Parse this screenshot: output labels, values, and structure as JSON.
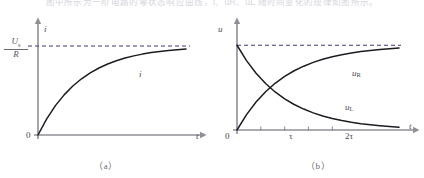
{
  "top_caption": "图中所示为一阶电路的零状态响应曲线，i、uR、uL 随时间变化的规律如图所示。",
  "panels": [
    {
      "id": "a",
      "caption": "（a）",
      "y_axis_label": "i",
      "x_axis_label": "t",
      "origin_label": "0",
      "asymptote_label_numerator": "U",
      "asymptote_label_numerator_sub": "s",
      "asymptote_label_denominator": "R",
      "curve_labels": [
        "i"
      ],
      "tick_labels": []
    },
    {
      "id": "b",
      "caption": "（b）",
      "y_axis_label": "u",
      "x_axis_label": "t",
      "origin_label": "0",
      "asymptote_label_numerator": "",
      "asymptote_label_numerator_sub": "",
      "asymptote_label_denominator": "",
      "curve_labels": [
        "uR",
        "uL"
      ],
      "curve_label_uR_base": "u",
      "curve_label_uR_sub": "R",
      "curve_label_uL_base": "u",
      "curve_label_uL_sub": "L",
      "tick_labels": [
        "τ",
        "2τ"
      ]
    }
  ],
  "colors": {
    "curve": "#1c1c22",
    "axis": "#8f8f96",
    "dashed": "#3a3a78",
    "text": "#4a4a50",
    "faint_text": "#d6d6dc",
    "background": "#ffffff"
  },
  "chart_data": [
    {
      "type": "line",
      "title": "(a)",
      "xlabel": "t",
      "ylabel": "i",
      "xlim": [
        0,
        3.4
      ],
      "ylim": [
        0,
        1.18
      ],
      "grid": false,
      "legend": "none",
      "asymptote": {
        "value": 1.0,
        "label": "Us/R",
        "style": "dashed"
      },
      "series": [
        {
          "name": "i",
          "formula": "i = (Us/R)(1 - exp(-t/tau))",
          "x": [
            0,
            0.2,
            0.4,
            0.6,
            0.8,
            1.0,
            1.2,
            1.4,
            1.6,
            1.8,
            2.0,
            2.2,
            2.4,
            2.6,
            2.8,
            3.0,
            3.2,
            3.4
          ],
          "y": [
            0,
            0.181,
            0.33,
            0.451,
            0.551,
            0.632,
            0.699,
            0.753,
            0.798,
            0.835,
            0.865,
            0.889,
            0.909,
            0.926,
            0.939,
            0.95,
            0.959,
            0.967
          ]
        }
      ],
      "xticks": [],
      "xticklabels": []
    },
    {
      "type": "line",
      "title": "(b)",
      "xlabel": "t",
      "ylabel": "u",
      "xlim": [
        0,
        3.4
      ],
      "ylim": [
        0,
        1.18
      ],
      "grid": false,
      "legend": "inline-labels",
      "asymptote": {
        "value": 1.0,
        "label": "",
        "style": "dashed"
      },
      "series": [
        {
          "name": "uR",
          "formula": "uR = Us(1 - exp(-t/tau))",
          "x": [
            0,
            0.2,
            0.4,
            0.6,
            0.8,
            1.0,
            1.2,
            1.4,
            1.6,
            1.8,
            2.0,
            2.2,
            2.4,
            2.6,
            2.8,
            3.0,
            3.2,
            3.4
          ],
          "y": [
            0,
            0.181,
            0.33,
            0.451,
            0.551,
            0.632,
            0.699,
            0.753,
            0.798,
            0.835,
            0.865,
            0.889,
            0.909,
            0.926,
            0.939,
            0.95,
            0.959,
            0.967
          ]
        },
        {
          "name": "uL",
          "formula": "uL = Us*exp(-t/tau)",
          "x": [
            0,
            0.2,
            0.4,
            0.6,
            0.8,
            1.0,
            1.2,
            1.4,
            1.6,
            1.8,
            2.0,
            2.2,
            2.4,
            2.6,
            2.8,
            3.0,
            3.2,
            3.4
          ],
          "y": [
            1.0,
            0.819,
            0.67,
            0.549,
            0.449,
            0.368,
            0.301,
            0.247,
            0.202,
            0.165,
            0.135,
            0.111,
            0.091,
            0.074,
            0.061,
            0.05,
            0.041,
            0.033
          ]
        }
      ],
      "xticks": [
        0.5,
        1.0,
        1.5,
        2.0
      ],
      "xticklabels": [
        "",
        "τ",
        "",
        "2τ"
      ],
      "labeled_xticks": [
        {
          "value": 1.0,
          "label": "τ"
        },
        {
          "value": 2.0,
          "label": "2τ"
        }
      ]
    }
  ]
}
